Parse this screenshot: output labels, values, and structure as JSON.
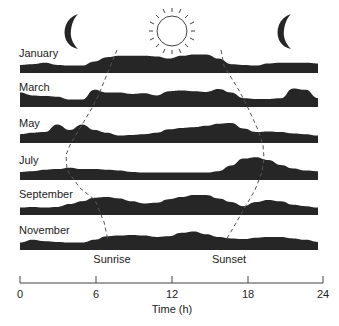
{
  "chart_data": {
    "type": "area",
    "title": "",
    "xlabel": "Time (h)",
    "ylabel": "",
    "xlim": [
      0,
      24
    ],
    "xticks": [
      0,
      6,
      12,
      18,
      24
    ],
    "xtick_labels": [
      "0",
      "6",
      "12",
      "18",
      "24"
    ],
    "grid": false,
    "legend": "none",
    "icons": [
      {
        "name": "moon",
        "x_hour": 3.3
      },
      {
        "name": "sun",
        "x_hour": 12.0
      },
      {
        "name": "moon",
        "x_hour": 20.4
      }
    ],
    "annotations": [
      {
        "text": "Sunrise",
        "x_hour": 6.3
      },
      {
        "text": "Sunset",
        "x_hour": 15.5
      }
    ],
    "sunrise_hours": {
      "January": 7.8,
      "March": 6.3,
      "May": 4.7,
      "July": 3.7,
      "September": 5.8,
      "November": 6.8
    },
    "sunset_hours": {
      "January": 16.0,
      "March": 17.5,
      "May": 18.6,
      "July": 19.3,
      "September": 17.3,
      "November": 15.7
    },
    "x": [
      0,
      1,
      2,
      3,
      4,
      5,
      6,
      7,
      8,
      9,
      10,
      11,
      12,
      13,
      14,
      15,
      16,
      17,
      18,
      19,
      20,
      21,
      22,
      23,
      24
    ],
    "series": [
      {
        "name": "January",
        "values": [
          0.15,
          0.2,
          0.3,
          0.15,
          0.1,
          0.1,
          0.4,
          0.7,
          0.8,
          0.8,
          0.8,
          0.75,
          0.6,
          0.8,
          0.9,
          0.9,
          0.6,
          0.2,
          0.15,
          0.1,
          0.25,
          0.3,
          0.3,
          0.3,
          0.25
        ]
      },
      {
        "name": "March",
        "values": [
          0.6,
          0.4,
          0.35,
          0.3,
          0.1,
          0.1,
          0.8,
          0.6,
          0.6,
          0.5,
          0.55,
          0.4,
          0.7,
          0.75,
          0.7,
          0.65,
          0.85,
          0.6,
          0.2,
          0.15,
          0.15,
          0.2,
          0.9,
          0.8,
          0.2
        ]
      },
      {
        "name": "May",
        "values": [
          0.2,
          0.3,
          0.35,
          0.9,
          0.5,
          0.9,
          0.5,
          0.3,
          0.1,
          0.15,
          0.2,
          0.3,
          0.55,
          0.65,
          0.7,
          0.8,
          0.95,
          1.0,
          0.6,
          0.35,
          0.4,
          0.35,
          0.25,
          0.2,
          0.1
        ]
      },
      {
        "name": "July",
        "values": [
          0.15,
          0.2,
          0.3,
          0.35,
          0.45,
          0.35,
          0.35,
          0.3,
          0.25,
          0.15,
          0.1,
          0.1,
          0.1,
          0.1,
          0.1,
          0.1,
          0.2,
          0.6,
          1.1,
          1.2,
          1.0,
          0.65,
          0.4,
          0.25,
          0.2
        ]
      },
      {
        "name": "September",
        "values": [
          0.1,
          0.15,
          0.1,
          0.15,
          0.35,
          0.55,
          0.8,
          0.85,
          0.75,
          0.55,
          0.4,
          0.45,
          0.7,
          0.85,
          1.0,
          1.0,
          0.75,
          0.5,
          0.2,
          0.5,
          0.65,
          0.55,
          0.3,
          0.2,
          0.1
        ]
      },
      {
        "name": "November",
        "values": [
          0.1,
          0.3,
          0.2,
          0.15,
          0.1,
          0.1,
          0.3,
          0.55,
          0.6,
          0.65,
          0.6,
          0.5,
          0.55,
          0.8,
          0.9,
          0.7,
          0.5,
          0.4,
          0.35,
          0.45,
          0.5,
          0.5,
          0.4,
          0.3,
          0.15
        ]
      }
    ]
  },
  "rows": [
    {
      "label": "January"
    },
    {
      "label": "March"
    },
    {
      "label": "May"
    },
    {
      "label": "July"
    },
    {
      "label": "September"
    },
    {
      "label": "November"
    }
  ],
  "axis": {
    "title": "Time (h)",
    "ticks": [
      "0",
      "6",
      "12",
      "18",
      "24"
    ]
  },
  "annotations": {
    "sunrise": "Sunrise",
    "sunset": "Sunset"
  },
  "colors": {
    "profile_fill": "#262626",
    "dashed_line": "#555555",
    "axis": "#444444"
  }
}
